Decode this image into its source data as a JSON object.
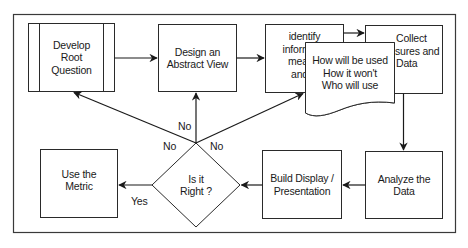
{
  "diagram": {
    "colors": {
      "stroke": "#2a2a2a",
      "background": "#ffffff",
      "text": "#1a1a1a"
    },
    "nodes": {
      "develop_root_question": {
        "label": "Develop Root Question",
        "lines": [
          "Develop",
          "Root",
          "Question"
        ],
        "shape": "predefined-process"
      },
      "design_abstract_view": {
        "label": "Design an Abstract View",
        "lines": [
          "Design an",
          "Abstract View"
        ],
        "shape": "rectangle"
      },
      "identify_information": {
        "label": "identify information measures and",
        "lines": [
          "identify",
          "inform",
          "meas",
          "and"
        ],
        "shape": "rectangle"
      },
      "collect_measures": {
        "label": "Collect Measures and Data",
        "lines": [
          "Collect",
          "sures and",
          "Data"
        ],
        "shape": "rectangle"
      },
      "usage_note": {
        "label": "How will be used / How it won't / Who will use",
        "lines": [
          "How will be used",
          "How it won't",
          "Who will use"
        ],
        "shape": "document"
      },
      "analyze_data": {
        "label": "Analyze the Data",
        "lines": [
          "Analyze the",
          "Data"
        ],
        "shape": "rectangle"
      },
      "build_display": {
        "label": "Build Display / Presentation",
        "lines": [
          "Build Display /",
          "Presentation"
        ],
        "shape": "rectangle"
      },
      "is_it_right": {
        "label": "Is it Right ?",
        "lines": [
          "Is it",
          "Right ?"
        ],
        "shape": "diamond"
      },
      "use_metric": {
        "label": "Use the Metric",
        "lines": [
          "Use the",
          "Metric"
        ],
        "shape": "rectangle"
      }
    },
    "edges": [
      {
        "from": "develop_root_question",
        "to": "design_abstract_view",
        "label": ""
      },
      {
        "from": "design_abstract_view",
        "to": "identify_information",
        "label": ""
      },
      {
        "from": "identify_information",
        "to": "collect_measures",
        "label": ""
      },
      {
        "from": "collect_measures",
        "to": "analyze_data",
        "label": ""
      },
      {
        "from": "analyze_data",
        "to": "build_display",
        "label": ""
      },
      {
        "from": "build_display",
        "to": "is_it_right",
        "label": ""
      },
      {
        "from": "is_it_right",
        "to": "use_metric",
        "label": "Yes"
      },
      {
        "from": "is_it_right",
        "to": "develop_root_question",
        "label": "No"
      },
      {
        "from": "is_it_right",
        "to": "design_abstract_view",
        "label": "No"
      },
      {
        "from": "is_it_right",
        "to": "identify_information",
        "label": "No"
      }
    ],
    "edge_labels": {
      "yes": "Yes",
      "no_left": "No",
      "no_up": "No",
      "no_right": "No"
    }
  }
}
